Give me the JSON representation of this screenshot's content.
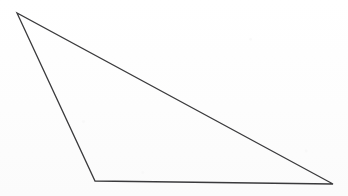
{
  "figure": {
    "shape_name": "triangle",
    "background_color": "#fefefe",
    "stroke_color": "#3a3a3c",
    "stroke_width": 1.3,
    "fill_color": "none",
    "canvas": {
      "width": 348,
      "height": 196
    },
    "vertices": [
      {
        "label": "apex-top-left",
        "x": 17,
        "y": 13
      },
      {
        "label": "vertex-bottom-left",
        "x": 95,
        "y": 181
      },
      {
        "label": "vertex-bottom-right",
        "x": 333,
        "y": 184
      }
    ],
    "edges": [
      {
        "name": "edge-top-hypotenuse",
        "from": "apex-top-left",
        "to": "vertex-bottom-right"
      },
      {
        "name": "edge-left",
        "from": "apex-top-left",
        "to": "vertex-bottom-left"
      },
      {
        "name": "edge-bottom",
        "from": "vertex-bottom-left",
        "to": "vertex-bottom-right"
      }
    ],
    "points_path": "17,13 95,181 333,184",
    "labels": [],
    "annotations": []
  }
}
